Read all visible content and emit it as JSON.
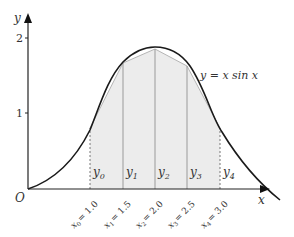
{
  "figure": {
    "type": "trapezium-rule-diagram",
    "axis_x_label": "x",
    "axis_y_label": "y",
    "origin_label": "O",
    "y_ticks": [
      {
        "value": 1,
        "label": "1"
      },
      {
        "value": 2,
        "label": "2"
      }
    ],
    "curve_label": "y = x sin x",
    "ordinates": [
      {
        "label": "y",
        "sub": "0",
        "x_label": "x",
        "x_sub": "0",
        "x_value": "= 1.0",
        "style": "dotted"
      },
      {
        "label": "y",
        "sub": "1",
        "x_label": "x",
        "x_sub": "1",
        "x_value": "= 1.5",
        "style": "solid"
      },
      {
        "label": "y",
        "sub": "2",
        "x_label": "x",
        "x_sub": "2",
        "x_value": "= 2.0",
        "style": "solid"
      },
      {
        "label": "y",
        "sub": "3",
        "x_label": "x",
        "x_sub": "3",
        "x_value": "= 2.5",
        "style": "solid"
      },
      {
        "label": "y",
        "sub": "4",
        "x_label": "x",
        "x_sub": "4",
        "x_value": "= 3.0",
        "style": "dotted"
      }
    ],
    "colors": {
      "curve": "#1a1a1a",
      "axes": "#222222",
      "shading": "#ececec",
      "ordinates": "#9a9a9a",
      "chords": "#b5b5b5"
    }
  }
}
